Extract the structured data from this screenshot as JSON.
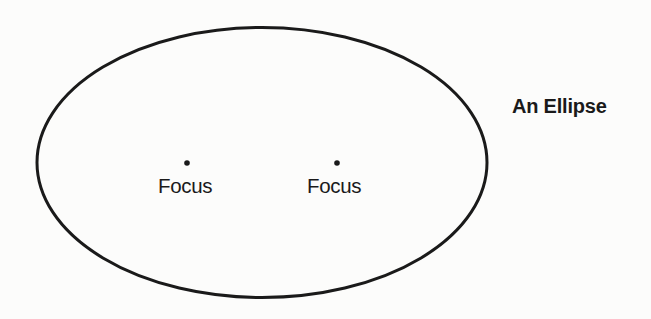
{
  "diagram": {
    "title": "An Ellipse",
    "ellipse": {
      "cx": 262,
      "cy": 162.5,
      "rx": 225,
      "ry": 135,
      "stroke": "#1a1a1a",
      "stroke_width": 3
    },
    "foci": [
      {
        "label": "Focus",
        "x": 187,
        "y": 163
      },
      {
        "label": "Focus",
        "x": 337,
        "y": 163
      }
    ],
    "colors": {
      "background": "#fcfcfb",
      "ink": "#1a1a1a"
    }
  }
}
